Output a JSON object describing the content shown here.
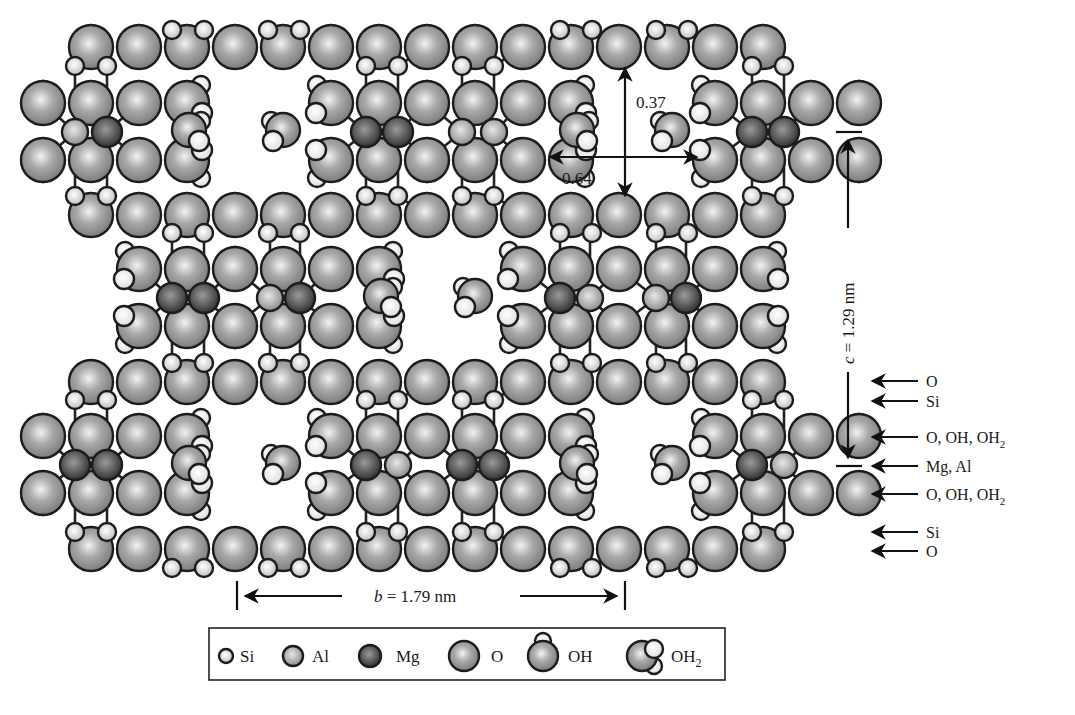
{
  "figure": {
    "colors": {
      "O": "#8f8f8f",
      "Al": "#9a9a9a",
      "Si": "#c8c8c8",
      "Mg": "#4a4a4a",
      "H": "#f4f4f4",
      "outline": "#1c1c1c"
    }
  },
  "annotations": {
    "channel_height": "0.37",
    "channel_width": "0.64",
    "c_axis_label_var": "c",
    "c_axis_label_value": " = 1.29 nm",
    "b_axis_label_var": "b",
    "b_axis_label_value": " = 1.79 nm"
  },
  "layer_labels": [
    {
      "text": "O",
      "sub": "",
      "y": 381
    },
    {
      "text": "Si",
      "sub": "",
      "y": 401
    },
    {
      "text": "O, OH, OH",
      "sub": "2",
      "y": 437
    },
    {
      "text": "Mg, Al",
      "sub": "",
      "y": 466
    },
    {
      "text": "O, OH, OH",
      "sub": "2",
      "y": 494
    },
    {
      "text": "Si",
      "sub": "",
      "y": 532
    },
    {
      "text": "O",
      "sub": "",
      "y": 551
    }
  ],
  "legend": {
    "items": [
      {
        "key": "Si",
        "label": "Si"
      },
      {
        "key": "Al",
        "label": "Al"
      },
      {
        "key": "Mg",
        "label": "Mg"
      },
      {
        "key": "O",
        "label": "O"
      },
      {
        "key": "OH",
        "label": "OH"
      },
      {
        "key": "OH2",
        "label": "OH",
        "sub": "2"
      }
    ]
  },
  "structure": {
    "pitch": 48,
    "ribbons": [
      {
        "name": "top-left",
        "x0": 43,
        "cols": 4,
        "cy": 132,
        "cations": [
          "Al",
          "Mg"
        ],
        "cation_x": [
          75,
          107
        ],
        "edge_left": "OH",
        "edge_right": "OH2"
      },
      {
        "name": "top-center",
        "x0": 331,
        "cols": 6,
        "cy": 132,
        "cations": [
          "Mg",
          "Mg",
          "Al",
          "Al"
        ],
        "cation_x": [
          366,
          398,
          462,
          494
        ],
        "edge_left": "OH2",
        "edge_right": "OH2"
      },
      {
        "name": "top-right",
        "x0": 715,
        "cols": 4,
        "cy": 132,
        "cations": [
          "Mg",
          "Mg"
        ],
        "cation_x": [
          752,
          784
        ],
        "edge_left": "OH2",
        "edge_right": "OH"
      },
      {
        "name": "mid-left",
        "x0": 139,
        "cols": 6,
        "cy": 298,
        "cations": [
          "Mg",
          "Mg",
          "Al",
          "Mg"
        ],
        "cation_x": [
          172,
          204,
          270,
          300
        ],
        "edge_left": "OH2",
        "edge_right": "OH2"
      },
      {
        "name": "mid-right",
        "x0": 523,
        "cols": 6,
        "cy": 298,
        "cations": [
          "Mg",
          "Al",
          "Al",
          "Mg"
        ],
        "cation_x": [
          560,
          590,
          656,
          686
        ],
        "edge_left": "OH2",
        "edge_right": "OH2"
      },
      {
        "name": "bot-left",
        "x0": 43,
        "cols": 4,
        "cy": 465,
        "cations": [
          "Mg",
          "Mg"
        ],
        "cation_x": [
          75,
          107
        ],
        "edge_left": "OH",
        "edge_right": "OH2"
      },
      {
        "name": "bot-center",
        "x0": 331,
        "cols": 6,
        "cy": 465,
        "cations": [
          "Mg",
          "Al",
          "Mg",
          "Mg"
        ],
        "cation_x": [
          366,
          398,
          462,
          494
        ],
        "edge_left": "OH2",
        "edge_right": "OH2"
      },
      {
        "name": "bot-right",
        "x0": 715,
        "cols": 4,
        "cy": 465,
        "cations": [
          "Mg",
          "Al"
        ],
        "cation_x": [
          752,
          784
        ],
        "edge_left": "OH2",
        "edge_right": "OH"
      }
    ],
    "channel_water": [
      {
        "x": 189,
        "y": 130,
        "dir": 1
      },
      {
        "x": 283,
        "y": 130,
        "dir": -1
      },
      {
        "x": 577,
        "y": 130,
        "dir": 1
      },
      {
        "x": 672,
        "y": 130,
        "dir": -1
      },
      {
        "x": 381,
        "y": 296,
        "dir": 1
      },
      {
        "x": 475,
        "y": 296,
        "dir": -1
      },
      {
        "x": 189,
        "y": 463,
        "dir": 1
      },
      {
        "x": 283,
        "y": 463,
        "dir": -1
      },
      {
        "x": 577,
        "y": 463,
        "dir": 1
      },
      {
        "x": 672,
        "y": 463,
        "dir": -1
      }
    ],
    "chains": [
      {
        "name": "chain-top",
        "y": 47,
        "si_up_y": 30,
        "si_dn_y": 66,
        "si_up_x": [
          172,
          204,
          268,
          300,
          560,
          592,
          656,
          688
        ],
        "si_dn_x": [
          75,
          107,
          366,
          398,
          462,
          494,
          752,
          784
        ]
      },
      {
        "name": "chain-upper-mid",
        "y": 215,
        "si_up_y": 196,
        "si_dn_y": 233,
        "si_up_x": [
          75,
          107,
          366,
          398,
          462,
          494,
          752,
          784
        ],
        "si_dn_x": [
          172,
          204,
          268,
          300,
          560,
          592,
          656,
          688
        ]
      },
      {
        "name": "chain-lower-mid",
        "y": 382,
        "si_up_y": 363,
        "si_dn_y": 400,
        "si_up_x": [
          172,
          204,
          268,
          300,
          560,
          592,
          656,
          688
        ],
        "si_dn_x": [
          75,
          107,
          366,
          398,
          462,
          494,
          752,
          784
        ]
      },
      {
        "name": "chain-bottom",
        "y": 549,
        "si_up_y": 532,
        "si_dn_y": 568,
        "si_up_x": [
          75,
          107,
          366,
          398,
          462,
          494,
          752,
          784
        ],
        "si_dn_x": [
          172,
          204,
          268,
          300,
          560,
          592,
          656,
          688
        ]
      }
    ]
  }
}
